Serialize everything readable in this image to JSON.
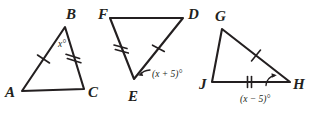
{
  "figure": {
    "stroke_color": "#231f20",
    "background_color": "#ffffff",
    "triangles": [
      {
        "name": "triangle-abc",
        "vertices": [
          {
            "label": "A",
            "x": 22,
            "y": 91
          },
          {
            "label": "B",
            "x": 65,
            "y": 27
          },
          {
            "label": "C",
            "x": 84,
            "y": 89
          }
        ],
        "vertex_label_positions": [
          {
            "label": "A",
            "x": 5,
            "y": 97
          },
          {
            "label": "B",
            "x": 66,
            "y": 19
          },
          {
            "label": "C",
            "x": 88,
            "y": 97
          }
        ],
        "ticks": [
          {
            "edge": "AB",
            "count": 1
          },
          {
            "edge": "BC",
            "count": 2
          }
        ],
        "angle": {
          "vertex": "B",
          "text": "x°",
          "x": 60,
          "y": 45
        }
      },
      {
        "name": "triangle-fde",
        "vertices": [
          {
            "label": "F",
            "x": 110,
            "y": 18
          },
          {
            "label": "D",
            "x": 183,
            "y": 18
          },
          {
            "label": "E",
            "x": 134,
            "y": 79
          }
        ],
        "vertex_label_positions": [
          {
            "label": "F",
            "x": 98,
            "y": 19
          },
          {
            "label": "D",
            "x": 188,
            "y": 19
          },
          {
            "label": "E",
            "x": 128,
            "y": 100
          }
        ],
        "ticks": [
          {
            "edge": "FE",
            "count": 2
          },
          {
            "edge": "ED",
            "count": 1
          }
        ],
        "angle": {
          "vertex": "E",
          "text": "(x + 5)°",
          "x": 152,
          "y": 79
        }
      },
      {
        "name": "triangle-gjh",
        "vertices": [
          {
            "label": "G",
            "x": 222,
            "y": 29
          },
          {
            "label": "J",
            "x": 212,
            "y": 82
          },
          {
            "label": "H",
            "x": 290,
            "y": 82
          }
        ],
        "vertex_label_positions": [
          {
            "label": "G",
            "x": 217,
            "y": 20
          },
          {
            "label": "J",
            "x": 200,
            "y": 89
          },
          {
            "label": "H",
            "x": 294,
            "y": 89
          }
        ],
        "ticks": [
          {
            "edge": "GH",
            "count": 1
          },
          {
            "edge": "JH",
            "count": 2
          }
        ],
        "angle": {
          "vertex": "H",
          "text": "(x − 5)°",
          "x": 242,
          "y": 102
        }
      }
    ],
    "labels": {
      "A": "A",
      "B": "B",
      "C": "C",
      "D": "D",
      "E": "E",
      "F": "F",
      "G": "G",
      "H": "H",
      "J": "J",
      "angle_b": "x°",
      "angle_e": "(x + 5)°",
      "angle_h": "(x − 5)°"
    }
  }
}
